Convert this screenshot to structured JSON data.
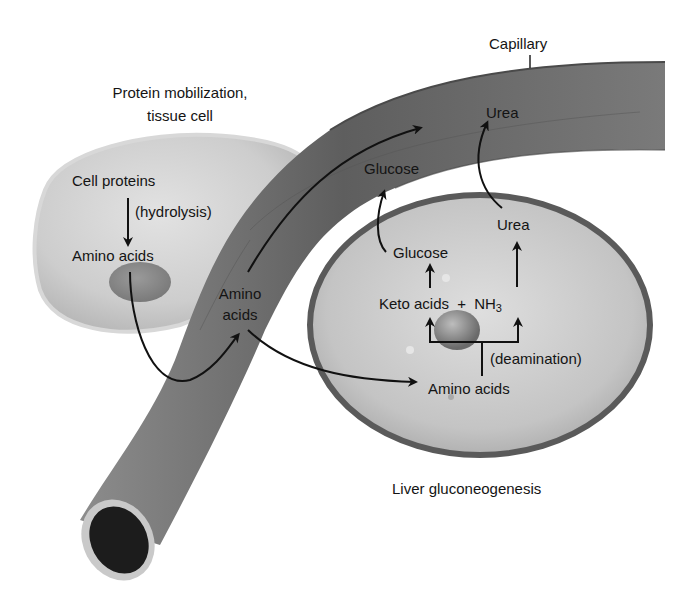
{
  "figure": {
    "tissue_cell": {
      "title_line1": "Protein mobilization,",
      "title_line2": "tissue cell",
      "cell_proteins": "Cell proteins",
      "hydrolysis": "(hydrolysis)",
      "amino_acids": "Amino acids"
    },
    "capillary": {
      "label": "Capillary",
      "amino_line1": "Amino",
      "amino_line2": "acids",
      "glucose": "Glucose",
      "urea": "Urea"
    },
    "liver": {
      "glucose": "Glucose",
      "urea": "Urea",
      "keto_acids": "Keto acids",
      "plus": "+",
      "nh": "NH",
      "nh_sub": "3",
      "deamination": "(deamination)",
      "amino_acids": "Amino acids",
      "caption": "Liver gluconeogenesis"
    },
    "colors": {
      "background": "#ffffff",
      "tissue_cell_fill": "#cfcfcf",
      "nucleus": "#8a8a8a",
      "capillary_fill": "#6e6e6e",
      "liver_fill": "#c6c6c6",
      "liver_border": "#5a5a5a",
      "arrow": "#111111"
    }
  }
}
